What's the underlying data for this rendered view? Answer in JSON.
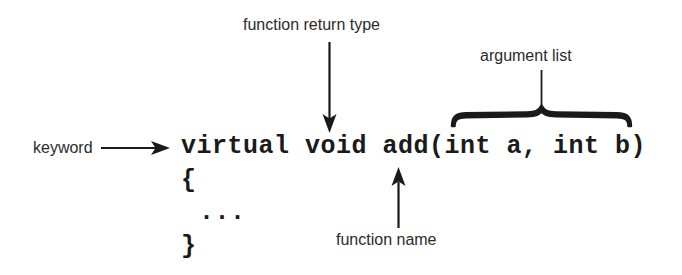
{
  "diagram": {
    "background_color": "#ffffff",
    "ink_color": "#1a1a1a",
    "code": {
      "signature": "virtual void add(int a, int b)",
      "open_brace": "{",
      "ellipsis": "...",
      "close_brace": "}"
    },
    "annotations": [
      {
        "id": "keyword",
        "label": "keyword",
        "points_to": "virtual",
        "connector": "horizontal-arrow-right"
      },
      {
        "id": "function-return-type",
        "label": "function return type",
        "points_to": "void",
        "connector": "vertical-arrow-down"
      },
      {
        "id": "function-name",
        "label": "function name",
        "points_to": "add",
        "connector": "vertical-arrow-up"
      },
      {
        "id": "argument-list",
        "label": "argument list",
        "points_to": "(int a, int b)",
        "connector": "curly-brace-over"
      }
    ]
  }
}
